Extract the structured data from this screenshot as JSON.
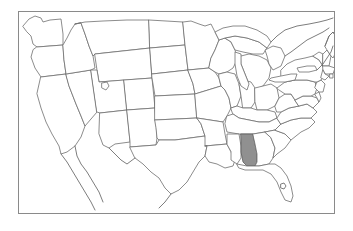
{
  "figure": {
    "type": "choropleth-locator-map",
    "title": "",
    "width": 353,
    "height": 231,
    "background_color": "#ffffff"
  },
  "frame": {
    "name": "map-border",
    "x": 18,
    "y": 11,
    "width": 317,
    "height": 203,
    "stroke_color": "#8a8a8a",
    "stroke_width": 1,
    "fill_color": "#ffffff"
  },
  "legend": {
    "present": false,
    "entries": []
  },
  "labels": {
    "present": false,
    "items": []
  },
  "styles": {
    "state_fill": "#ffffff",
    "state_stroke": "#6e6e6e",
    "highlight_fill": "#909090",
    "highlight_stroke": "#5a5a5a",
    "lake_fill": "#ffffff",
    "coastline_stroke": "#6e6e6e"
  },
  "chart_data": {
    "type": "map",
    "projection_hint": "conic (contiguous United States)",
    "highlighted_count": 1,
    "highlighted_states": [
      "Alabama"
    ],
    "highlight_color": "#909090",
    "unhighlighted_color": "#ffffff",
    "border_color": "#6e6e6e",
    "regions": [
      {
        "name": "Washington",
        "highlighted": false
      },
      {
        "name": "Oregon",
        "highlighted": false
      },
      {
        "name": "California",
        "highlighted": false
      },
      {
        "name": "Idaho",
        "highlighted": false
      },
      {
        "name": "Nevada",
        "highlighted": false
      },
      {
        "name": "Montana",
        "highlighted": false
      },
      {
        "name": "Wyoming",
        "highlighted": false
      },
      {
        "name": "Utah",
        "highlighted": false
      },
      {
        "name": "Arizona",
        "highlighted": false
      },
      {
        "name": "Colorado",
        "highlighted": false
      },
      {
        "name": "New Mexico",
        "highlighted": false
      },
      {
        "name": "North Dakota",
        "highlighted": false
      },
      {
        "name": "South Dakota",
        "highlighted": false
      },
      {
        "name": "Nebraska",
        "highlighted": false
      },
      {
        "name": "Kansas",
        "highlighted": false
      },
      {
        "name": "Oklahoma",
        "highlighted": false
      },
      {
        "name": "Texas",
        "highlighted": false
      },
      {
        "name": "Minnesota",
        "highlighted": false
      },
      {
        "name": "Iowa",
        "highlighted": false
      },
      {
        "name": "Missouri",
        "highlighted": false
      },
      {
        "name": "Arkansas",
        "highlighted": false
      },
      {
        "name": "Louisiana",
        "highlighted": false
      },
      {
        "name": "Wisconsin",
        "highlighted": false
      },
      {
        "name": "Illinois",
        "highlighted": false
      },
      {
        "name": "Michigan",
        "highlighted": false
      },
      {
        "name": "Indiana",
        "highlighted": false
      },
      {
        "name": "Ohio",
        "highlighted": false
      },
      {
        "name": "Kentucky",
        "highlighted": false
      },
      {
        "name": "Tennessee",
        "highlighted": false
      },
      {
        "name": "Mississippi",
        "highlighted": false
      },
      {
        "name": "Alabama",
        "highlighted": true
      },
      {
        "name": "Georgia",
        "highlighted": false
      },
      {
        "name": "Florida",
        "highlighted": false
      },
      {
        "name": "South Carolina",
        "highlighted": false
      },
      {
        "name": "North Carolina",
        "highlighted": false
      },
      {
        "name": "Virginia",
        "highlighted": false
      },
      {
        "name": "West Virginia",
        "highlighted": false
      },
      {
        "name": "Maryland",
        "highlighted": false
      },
      {
        "name": "Delaware",
        "highlighted": false
      },
      {
        "name": "Pennsylvania",
        "highlighted": false
      },
      {
        "name": "New Jersey",
        "highlighted": false
      },
      {
        "name": "New York",
        "highlighted": false
      },
      {
        "name": "Connecticut",
        "highlighted": false
      },
      {
        "name": "Rhode Island",
        "highlighted": false
      },
      {
        "name": "Massachusetts",
        "highlighted": false
      },
      {
        "name": "Vermont",
        "highlighted": false
      },
      {
        "name": "New Hampshire",
        "highlighted": false
      },
      {
        "name": "Maine",
        "highlighted": false
      }
    ],
    "water_features": [
      "Lake Superior",
      "Lake Michigan",
      "Lake Huron",
      "Lake Erie",
      "Lake Ontario",
      "Great Salt Lake"
    ],
    "grid": false,
    "axis_labels": {
      "x": "",
      "y": ""
    },
    "tick_labels": []
  }
}
